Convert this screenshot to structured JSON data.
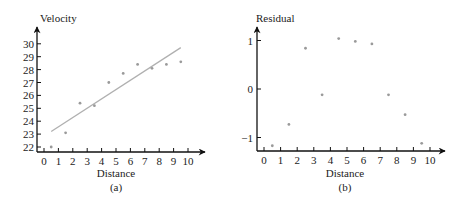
{
  "chart_data": [
    {
      "type": "scatter",
      "panel": "(a)",
      "title": "",
      "xlabel": "Distance",
      "ylabel": "Velocity",
      "caption": "(a)",
      "xlim": [
        0,
        10
      ],
      "ylim": [
        22,
        30
      ],
      "x_ticks": [
        "0",
        "1",
        "2",
        "3",
        "4",
        "5",
        "6",
        "7",
        "8",
        "9",
        "10"
      ],
      "y_ticks": [
        "22",
        "23",
        "24",
        "25",
        "26",
        "27",
        "28",
        "29",
        "30"
      ],
      "grid": false,
      "legend": null,
      "points": {
        "x": [
          0.5,
          1.5,
          2.5,
          3.5,
          4.5,
          5.5,
          6.5,
          7.5,
          8.5,
          9.5
        ],
        "y": [
          22.0,
          23.1,
          25.4,
          25.2,
          27.0,
          27.7,
          28.4,
          28.1,
          28.4,
          28.6
        ]
      },
      "fit_line": {
        "x": [
          0.5,
          9.5
        ],
        "y": [
          23.2,
          29.7
        ]
      },
      "point_color": "#9a9a9a",
      "line_color": "#b0b0b0"
    },
    {
      "type": "scatter",
      "panel": "(b)",
      "title": "",
      "xlabel": "Distance",
      "ylabel": "Residual",
      "caption": "(b)",
      "xlim": [
        0,
        10
      ],
      "ylim": [
        -1.25,
        1.2
      ],
      "x_ticks": [
        "0",
        "1",
        "2",
        "3",
        "4",
        "5",
        "6",
        "7",
        "8",
        "9",
        "10"
      ],
      "y_ticks": [
        "−1",
        "0",
        "1"
      ],
      "grid": false,
      "legend": null,
      "points": {
        "x": [
          0.5,
          1.5,
          2.5,
          3.5,
          4.5,
          5.5,
          6.5,
          7.5,
          8.5,
          9.5
        ],
        "y": [
          -1.17,
          -0.73,
          0.84,
          -0.12,
          1.04,
          0.98,
          0.93,
          -0.12,
          -0.53,
          -1.12
        ]
      },
      "point_color": "#9a9a9a"
    }
  ]
}
